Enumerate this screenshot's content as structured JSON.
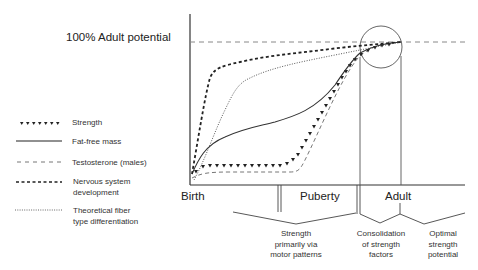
{
  "diagram": {
    "y_reference_label": "100% Adult potential",
    "x_axis": {
      "labels": [
        "Birth",
        "Puberty",
        "Adult"
      ]
    },
    "legend": [
      {
        "name": "strength",
        "label": "Strength",
        "style": "triangles"
      },
      {
        "name": "fat-free-mass",
        "label": "Fat-free mass",
        "style": "solid"
      },
      {
        "name": "testosterone",
        "label": "Testosterone (males)",
        "style": "long-dash"
      },
      {
        "name": "nervous-system",
        "label": "Nervous system development",
        "label_lines": [
          "Nervous system",
          "development"
        ],
        "style": "bold-short-dash"
      },
      {
        "name": "fiber-type",
        "label": "Theoretical fiber type differentiation",
        "label_lines": [
          "Theoretical fiber",
          "type differentiation"
        ],
        "style": "dotted"
      }
    ],
    "brackets": [
      {
        "label_lines": [
          "Strength",
          "primarily via",
          "motor patterns"
        ]
      },
      {
        "label_lines": [
          "Consolidation",
          "of strength",
          "factors"
        ]
      },
      {
        "label_lines": [
          "Optimal",
          "strength",
          "potential"
        ]
      }
    ],
    "colors": {
      "line": "#333333",
      "reference": "#888888"
    }
  }
}
